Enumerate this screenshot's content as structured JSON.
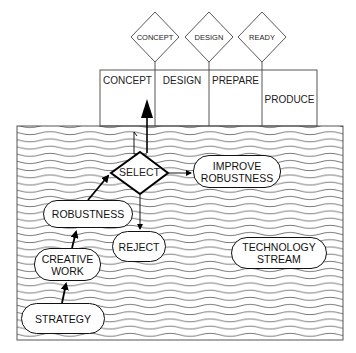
{
  "gates": [
    {
      "label": "CONCEPT"
    },
    {
      "label": "DESIGN"
    },
    {
      "label": "READY"
    }
  ],
  "phases": [
    {
      "label": "CONCEPT"
    },
    {
      "label": "DESIGN"
    },
    {
      "label": "PREPARE"
    },
    {
      "label": "PRODUCE"
    }
  ],
  "stream": {
    "label_line1": "TECHNOLOGY",
    "label_line2": "STREAM"
  },
  "nodes": {
    "select": "SELECT",
    "improve_line1": "IMPROVE",
    "improve_line2": "ROBUSTNESS",
    "robustness": "ROBUSTNESS",
    "reject": "REJECT",
    "creative_line1": "CREATIVE",
    "creative_line2": "WORK",
    "strategy": "STRATEGY"
  }
}
